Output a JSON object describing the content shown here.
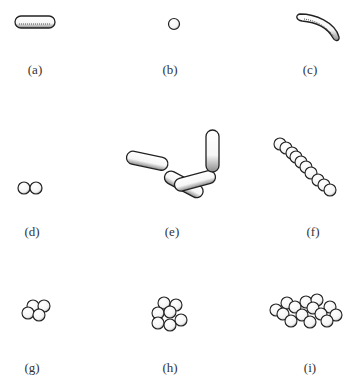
{
  "figure": {
    "panels": [
      {
        "id": "a",
        "label": "(a)",
        "shape": "single rod (bacillus)"
      },
      {
        "id": "b",
        "label": "(b)",
        "shape": "single coccus"
      },
      {
        "id": "c",
        "label": "(c)",
        "shape": "curved rod (vibrio)"
      },
      {
        "id": "d",
        "label": "(d)",
        "shape": "diplococci (pair of cocci)"
      },
      {
        "id": "e",
        "label": "(e)",
        "shape": "streptobacilli (chain of rods)"
      },
      {
        "id": "f",
        "label": "(f)",
        "shape": "streptococci (chain of cocci)"
      },
      {
        "id": "g",
        "label": "(g)",
        "shape": "tetrad (group of four cocci)"
      },
      {
        "id": "h",
        "label": "(h)",
        "shape": "sarcina (cubical packet of eight cocci)"
      },
      {
        "id": "i",
        "label": "(i)",
        "shape": "staphylococci (irregular cluster of cocci)"
      }
    ]
  }
}
